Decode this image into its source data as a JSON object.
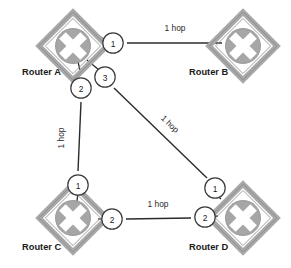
{
  "diagram": {
    "type": "network-topology",
    "colors": {
      "link": "#2b2b2b",
      "router_band": "#a8a8a8",
      "router_band_edge": "#8c8c8c",
      "router_disc": "#a6a6a6",
      "router_cross": "#ffffff",
      "port_fill": "#ffffff",
      "port_stroke": "#3a3a3a",
      "text": "#1a1a1a",
      "background": "#ffffff"
    },
    "routers": [
      {
        "id": "A",
        "label": "Router A",
        "icon": "router-icon",
        "cx": 73,
        "cy": 46,
        "label_x": 22,
        "label_y": 75
      },
      {
        "id": "B",
        "label": "Router B",
        "icon": "router-icon",
        "cx": 243,
        "cy": 46,
        "label_x": 189,
        "label_y": 75
      },
      {
        "id": "C",
        "label": "Router C",
        "icon": "router-icon",
        "cx": 73,
        "cy": 218,
        "label_x": 22,
        "label_y": 250
      },
      {
        "id": "D",
        "label": "Router D",
        "icon": "router-icon",
        "cx": 243,
        "cy": 218,
        "label_x": 189,
        "label_y": 250
      }
    ],
    "ports": [
      {
        "router": "A",
        "number": "1",
        "cx": 113,
        "cy": 43
      },
      {
        "router": "A",
        "number": "3",
        "cx": 105,
        "cy": 77
      },
      {
        "router": "A",
        "number": "2",
        "cx": 81,
        "cy": 88
      },
      {
        "router": "C",
        "number": "1",
        "cx": 78,
        "cy": 185
      },
      {
        "router": "C",
        "number": "2",
        "cx": 112,
        "cy": 219
      },
      {
        "router": "D",
        "number": "1",
        "cx": 215,
        "cy": 188
      },
      {
        "router": "D",
        "number": "2",
        "cx": 205,
        "cy": 217
      }
    ],
    "links": [
      {
        "id": "a1-b",
        "from": "Router A port 1",
        "to": "Router B",
        "hops": "1 hop",
        "x1": 127,
        "y1": 43,
        "x2": 222,
        "y2": 43,
        "label_x": 175,
        "label_y": 31,
        "label_rotation": 0
      },
      {
        "id": "a2-c1",
        "from": "Router A port 2",
        "to": "Router C port 1",
        "hops": "1 hop",
        "x1": 81,
        "y1": 102,
        "x2": 78,
        "y2": 171,
        "label_x": 64,
        "label_y": 138,
        "label_rotation": -90
      },
      {
        "id": "a3-d1",
        "from": "Router A port 3",
        "to": "Router D port 1",
        "hops": "1 hop",
        "x1": 114,
        "y1": 88,
        "x2": 207,
        "y2": 178,
        "label_x": 168,
        "label_y": 126,
        "label_rotation": 44
      },
      {
        "id": "c2-d2",
        "from": "Router C port 2",
        "to": "Router D port 2",
        "hops": "1 hop",
        "x1": 126,
        "y1": 219,
        "x2": 191,
        "y2": 218,
        "label_x": 158,
        "label_y": 207,
        "label_rotation": 0
      }
    ],
    "stub_links": [
      {
        "id": "a-to-port1",
        "x1": 92,
        "y1": 32,
        "x2": 104,
        "y2": 39
      },
      {
        "id": "a-to-port3",
        "x1": 87,
        "y1": 60,
        "x2": 99,
        "y2": 70
      },
      {
        "id": "a-to-port2",
        "x1": 78,
        "y1": 62,
        "x2": 81,
        "y2": 74
      },
      {
        "id": "c-to-port1",
        "x1": 77,
        "y1": 199,
        "x2": 78,
        "y2": 192
      },
      {
        "id": "c-to-port2",
        "x1": 98,
        "y1": 219,
        "x2": 105,
        "y2": 219
      },
      {
        "id": "d-to-port1",
        "x1": 220,
        "y1": 198,
        "x2": 216,
        "y2": 195
      },
      {
        "id": "d-to-port2",
        "x1": 217,
        "y1": 216,
        "x2": 212,
        "y2": 217
      }
    ]
  }
}
